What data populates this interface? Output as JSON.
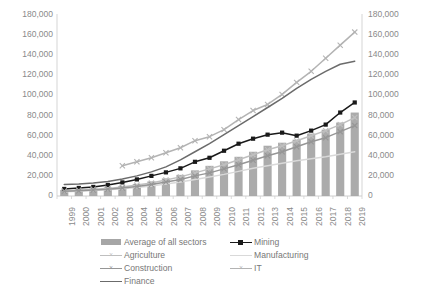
{
  "chart_data": {
    "type": "bar",
    "title": "",
    "subtitle": "",
    "xlabel": "",
    "ylabel": "",
    "ylim": [
      0,
      180000
    ],
    "y_ticks": [
      "0",
      "20,000",
      "40,000",
      "60,000",
      "80,000",
      "100,000",
      "120,000",
      "140,000",
      "160,000",
      "180,000"
    ],
    "y_tick_values": [
      0,
      20000,
      40000,
      60000,
      80000,
      100000,
      120000,
      140000,
      160000,
      180000
    ],
    "secondary_axis": true,
    "secondary_y_ticks": [
      "0",
      "20,000",
      "40,000",
      "60,000",
      "80,000",
      "100,000",
      "120,000",
      "140,000",
      "160,000",
      "180,000"
    ],
    "grid": false,
    "legend_position": "bottom",
    "categories": [
      "1999",
      "2000",
      "2001",
      "2002",
      "2003",
      "2004",
      "2005",
      "2006",
      "2007",
      "2008",
      "2009",
      "2010",
      "2011",
      "2012",
      "2013",
      "2014",
      "2015",
      "2016",
      "2017",
      "2018",
      "2019"
    ],
    "series": [
      {
        "name": "Average of all sectors",
        "type": "bar",
        "color": "#a6a6a6",
        "values": [
          6000,
          6800,
          7600,
          8600,
          10000,
          12000,
          14500,
          17500,
          21000,
          25500,
          30000,
          34500,
          39000,
          44000,
          50000,
          53000,
          56000,
          62000,
          66000,
          73000,
          83000
        ]
      },
      {
        "name": "Mining",
        "type": "line",
        "marker": "square",
        "color": "#1a1a1a",
        "values": [
          7000,
          8000,
          9000,
          11000,
          13500,
          16500,
          20000,
          23500,
          27500,
          34000,
          38000,
          45000,
          52000,
          57000,
          61000,
          63000,
          60000,
          65000,
          71000,
          83000,
          93000
        ]
      },
      {
        "name": "Agriculture",
        "type": "line",
        "marker": "x",
        "color": "#bfbfbf",
        "values": [
          5000,
          5800,
          6600,
          7500,
          9000,
          11000,
          13000,
          16000,
          19000,
          23000,
          27000,
          31000,
          36000,
          41000,
          46000,
          50000,
          55000,
          60000,
          65000,
          71000,
          78000
        ]
      },
      {
        "name": "Manufacturing",
        "type": "line",
        "marker": "none",
        "color": "#d9d9d9",
        "values": [
          4200,
          4800,
          5500,
          6200,
          7200,
          8500,
          10000,
          12000,
          14000,
          16500,
          19000,
          21500,
          24500,
          27500,
          30000,
          32500,
          35000,
          37000,
          39000,
          41500,
          44000
        ]
      },
      {
        "name": "Construction",
        "type": "line",
        "marker": "x",
        "color": "#969696",
        "values": [
          4600,
          5200,
          6000,
          6800,
          8000,
          9500,
          11500,
          14000,
          16500,
          20000,
          23000,
          27000,
          31000,
          35500,
          40000,
          44000,
          49000,
          54000,
          58000,
          64000,
          70000
        ]
      },
      {
        "name": "IT",
        "type": "line",
        "marker": "x",
        "color": "#b3b3b3",
        "values": [
          null,
          null,
          null,
          null,
          30000,
          34000,
          38000,
          43000,
          48000,
          55000,
          59000,
          66000,
          76000,
          85000,
          91000,
          101000,
          113000,
          124000,
          137000,
          150000,
          163000
        ]
      },
      {
        "name": "Finance",
        "type": "line",
        "marker": "none",
        "color": "#6b6b6b",
        "values": [
          11500,
          12000,
          13000,
          14500,
          17000,
          20000,
          24000,
          29000,
          36000,
          44000,
          52000,
          61000,
          70000,
          79000,
          88000,
          97000,
          107000,
          116000,
          124000,
          131000,
          134000
        ]
      }
    ]
  },
  "legend": {
    "items": [
      {
        "label": "Average of all sectors",
        "key": "bar-swatch",
        "color": "#a6a6a6",
        "name": "average-of-all-sectors"
      },
      {
        "label": "Mining",
        "key": "line-square",
        "color": "#1a1a1a",
        "name": "mining"
      },
      {
        "label": "Agriculture",
        "key": "line-x",
        "color": "#bfbfbf",
        "name": "agriculture"
      },
      {
        "label": "Manufacturing",
        "key": "line-plain-light",
        "color": "#d9d9d9",
        "name": "manufacturing"
      },
      {
        "label": "Construction",
        "key": "line-x",
        "color": "#969696",
        "name": "construction"
      },
      {
        "label": "IT",
        "key": "line-x",
        "color": "#b3b3b3",
        "name": "it"
      },
      {
        "label": "Finance",
        "key": "line-plain",
        "color": "#6b6b6b",
        "name": "finance"
      }
    ]
  },
  "axes": {
    "left_label": "",
    "right_label": "",
    "axis_color": "#d0d0d0",
    "tick_text_color": "#8a8a8a"
  }
}
